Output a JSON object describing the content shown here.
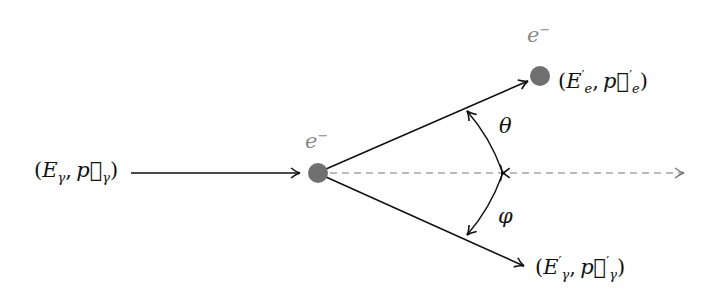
{
  "diagram": {
    "incoming_photon": {
      "E": "E",
      "sub": "γ",
      "p": "p⃗",
      "p_sub": "γ",
      "open": "(",
      "close": ")",
      "comma": ","
    },
    "electron_initial": {
      "symbol": "e",
      "charge": "−"
    },
    "electron_final": {
      "symbol": "e",
      "charge": "−",
      "E": "E",
      "prime": "′",
      "sub": "e",
      "p": "p⃗",
      "p_sub": "e",
      "open": "(",
      "close": ")",
      "comma": ","
    },
    "photon_final": {
      "E": "E",
      "prime": "′",
      "sub": "γ",
      "p": "p⃗",
      "p_sub": "γ",
      "open": "(",
      "close": ")",
      "comma": ","
    },
    "angles": {
      "theta": "θ",
      "phi": "φ"
    },
    "colors": {
      "line": "#111111",
      "electron": "#707070",
      "label_gray": "#888888",
      "dashed": "#777777"
    }
  }
}
